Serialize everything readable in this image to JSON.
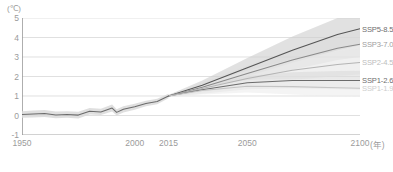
{
  "chart_data": {
    "type": "line",
    "title": "",
    "subtitle": "",
    "xlabel": "年",
    "ylabel": "(℃)",
    "yunit": "(℃)",
    "xunit": "(年)",
    "xlim": [
      1950,
      2100
    ],
    "ylim": [
      -1,
      5
    ],
    "ytick_values": [
      5,
      4,
      3,
      2,
      1,
      0,
      -1
    ],
    "ytick_labels": [
      "5",
      "4",
      "3",
      "2",
      "1",
      "0",
      "-1"
    ],
    "xtick_values": [
      1950,
      1960,
      1970,
      1980,
      1990,
      2000,
      2010,
      2015,
      2020,
      2030,
      2040,
      2050,
      2060,
      2070,
      2080,
      2090,
      2100
    ],
    "xtick_labels_shown": [
      "1950",
      "2000",
      "2015",
      "2050",
      "2100"
    ],
    "xtick_label_values": [
      1950,
      2000,
      2015,
      2050,
      2100
    ],
    "grid": true,
    "grid_axis": "y",
    "legend_position": "right-inline",
    "historical": {
      "name": "historical",
      "color": "#6b6b6b",
      "band_color": "#d9d9d9",
      "x": [
        1950,
        1955,
        1960,
        1965,
        1970,
        1975,
        1980,
        1985,
        1990,
        1992,
        1995,
        2000,
        2005,
        2010,
        2015
      ],
      "values": [
        0.05,
        0.08,
        0.1,
        0.03,
        0.05,
        0.02,
        0.22,
        0.18,
        0.38,
        0.16,
        0.32,
        0.45,
        0.62,
        0.72,
        1.0
      ],
      "band_low": [
        -0.12,
        -0.1,
        -0.08,
        -0.14,
        -0.12,
        -0.15,
        0.05,
        0.02,
        0.2,
        0.0,
        0.16,
        0.3,
        0.48,
        0.58,
        0.88
      ],
      "band_high": [
        0.22,
        0.26,
        0.28,
        0.2,
        0.22,
        0.19,
        0.39,
        0.34,
        0.56,
        0.32,
        0.48,
        0.6,
        0.76,
        0.86,
        1.12
      ]
    },
    "series": [
      {
        "name": "SSP5-8.5",
        "label": "SSP5-8.5",
        "color": "#555555",
        "label_color": "#6e6e6e",
        "band_color": "#cfcfcf",
        "x": [
          2015,
          2030,
          2050,
          2070,
          2090,
          2100
        ],
        "values": [
          1.0,
          1.55,
          2.45,
          3.35,
          4.15,
          4.45
        ],
        "band_low": [
          0.95,
          1.3,
          2.0,
          2.7,
          3.35,
          3.6
        ],
        "band_high": [
          1.05,
          1.8,
          2.95,
          4.05,
          5.0,
          5.35
        ],
        "end_value": 4.45
      },
      {
        "name": "SSP3-7.0",
        "label": "SSP3-7.0",
        "color": "#8a8a8a",
        "label_color": "#9e9e9e",
        "band_color": "#dcdcdc",
        "x": [
          2015,
          2030,
          2050,
          2070,
          2090,
          2100
        ],
        "values": [
          1.0,
          1.45,
          2.15,
          2.85,
          3.45,
          3.65
        ],
        "band_low": [
          0.95,
          1.25,
          1.8,
          2.35,
          2.85,
          3.0
        ],
        "band_high": [
          1.05,
          1.68,
          2.55,
          3.4,
          4.1,
          4.35
        ],
        "end_value": 3.65
      },
      {
        "name": "SSP2-4.5",
        "label": "SSP2-4.5",
        "color": "#b4b4b4",
        "label_color": "#bdbdbd",
        "band_color": "#e6e6e6",
        "x": [
          2015,
          2030,
          2050,
          2070,
          2090,
          2100
        ],
        "values": [
          1.0,
          1.38,
          1.9,
          2.32,
          2.62,
          2.72
        ],
        "band_low": [
          0.95,
          1.18,
          1.52,
          1.82,
          2.02,
          2.1
        ],
        "band_high": [
          1.05,
          1.6,
          2.3,
          2.88,
          3.28,
          3.42
        ],
        "end_value": 2.72
      },
      {
        "name": "SSP1-2.6",
        "label": "SSP1-2.6",
        "color": "#6b6b6b",
        "label_color": "#6e6e6e",
        "band_color": "#dcdcdc",
        "x": [
          2015,
          2030,
          2050,
          2070,
          2090,
          2100
        ],
        "values": [
          1.0,
          1.32,
          1.68,
          1.8,
          1.8,
          1.8
        ],
        "band_low": [
          0.95,
          1.12,
          1.35,
          1.4,
          1.35,
          1.32
        ],
        "band_high": [
          1.05,
          1.52,
          2.02,
          2.22,
          2.28,
          2.3
        ],
        "end_value": 1.8
      },
      {
        "name": "SSP1-1.9",
        "label": "SSP1-1.9",
        "color": "#c4c4c4",
        "label_color": "#cdcdcd",
        "band_color": "#ededed",
        "x": [
          2015,
          2030,
          2050,
          2070,
          2090,
          2100
        ],
        "values": [
          1.0,
          1.28,
          1.5,
          1.48,
          1.42,
          1.4
        ],
        "band_low": [
          0.95,
          1.08,
          1.18,
          1.08,
          0.98,
          0.95
        ],
        "band_high": [
          1.05,
          1.48,
          1.82,
          1.88,
          1.86,
          1.85
        ],
        "end_value": 1.4
      }
    ]
  },
  "axes": {
    "y_unit_label": "(℃)",
    "x_unit_label": "(年)"
  },
  "caption": ""
}
